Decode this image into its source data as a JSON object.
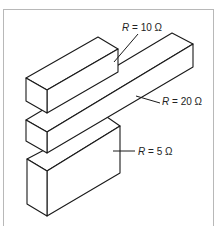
{
  "diagram": {
    "title": "",
    "resistors": [
      {
        "id": "top",
        "label_var": "R",
        "label_eq": " = ",
        "label_value": "10 Ω",
        "resistance_ohms": 10
      },
      {
        "id": "middle",
        "label_var": "R",
        "label_eq": " = ",
        "label_value": "20 Ω",
        "resistance_ohms": 20
      },
      {
        "id": "bottom",
        "label_var": "R",
        "label_eq": " = ",
        "label_value": "5 Ω",
        "resistance_ohms": 5
      }
    ],
    "colors": {
      "line": "#1a1a1a",
      "background": "#ffffff",
      "frame": "#b8b8b8"
    }
  }
}
